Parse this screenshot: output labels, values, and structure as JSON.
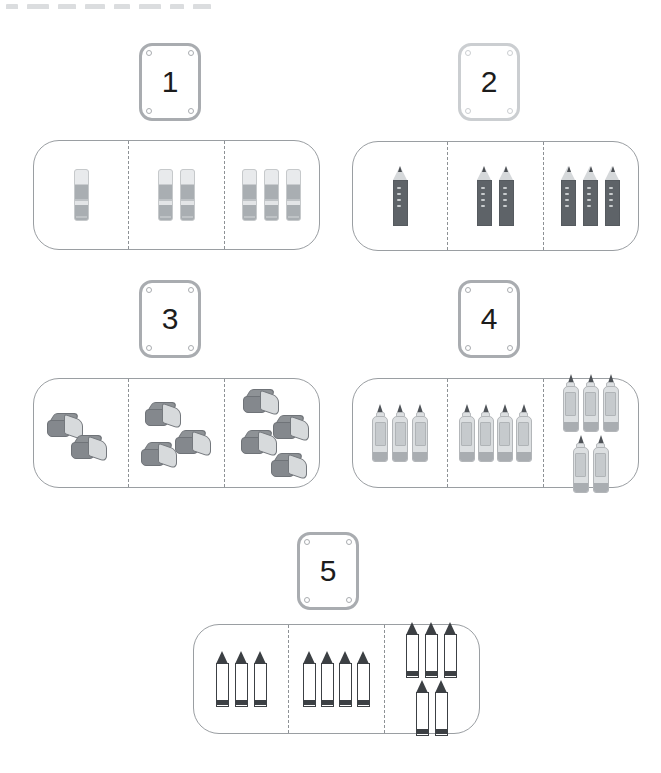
{
  "page": {
    "background_color": "#ffffff",
    "panel_border_color": "#9a9ea2",
    "divider_style": "dashed",
    "card_border_color": "#a9acb0"
  },
  "toolbar_strip": {
    "visible": true,
    "note": "cut-off toolbar row at very top of screenshot",
    "chips": [
      12,
      22,
      18,
      20,
      16,
      22,
      14,
      18
    ]
  },
  "exercises": [
    {
      "number": "1",
      "item_name": "glue-stick",
      "card_tone": "dark",
      "sections": [
        {
          "count": 1,
          "count_label": "1"
        },
        {
          "count": 2,
          "count_label": "2"
        },
        {
          "count": 3,
          "count_label": "3"
        }
      ]
    },
    {
      "number": "2",
      "item_name": "pencil",
      "card_tone": "light",
      "sections": [
        {
          "count": 1,
          "count_label": "1"
        },
        {
          "count": 2,
          "count_label": "2"
        },
        {
          "count": 3,
          "count_label": "3"
        }
      ]
    },
    {
      "number": "3",
      "item_name": "eraser",
      "card_tone": "dark",
      "sections": [
        {
          "count": 2,
          "count_label": "2"
        },
        {
          "count": 3,
          "count_label": "3"
        },
        {
          "count": 4,
          "count_label": "4"
        }
      ]
    },
    {
      "number": "4",
      "item_name": "glue-bottle",
      "card_tone": "dark",
      "sections": [
        {
          "count": 3,
          "count_label": "3"
        },
        {
          "count": 4,
          "count_label": "4"
        },
        {
          "count": 5,
          "count_label": "5"
        }
      ]
    },
    {
      "number": "5",
      "item_name": "crayon",
      "card_tone": "dark",
      "sections": [
        {
          "count": 3,
          "count_label": "3"
        },
        {
          "count": 4,
          "count_label": "4"
        },
        {
          "count": 5,
          "count_label": "5"
        }
      ]
    }
  ]
}
